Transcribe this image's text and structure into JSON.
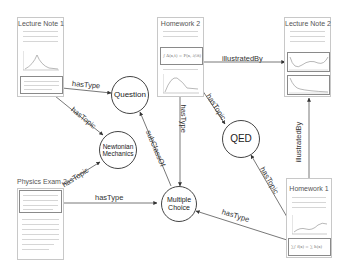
{
  "documents": [
    {
      "id": "lecture-note-1",
      "title": "Lecture Note 1"
    },
    {
      "id": "homework-2",
      "title": "Homework 2"
    },
    {
      "id": "lecture-note-2",
      "title": "Lecture Note 2"
    },
    {
      "id": "physics-exam-2",
      "title": "Physics Exam 2"
    },
    {
      "id": "homework-1",
      "title": "Homework 1"
    }
  ],
  "concepts": [
    {
      "id": "question",
      "label": "Question"
    },
    {
      "id": "newtonian-mechanics",
      "label_line1": "Newtonian",
      "label_line2": "Mechanics"
    },
    {
      "id": "qed",
      "label": "QED"
    },
    {
      "id": "multiple-choice",
      "label_line1": "Multiple",
      "label_line2": "Choice"
    }
  ],
  "edges": [
    {
      "from": "lecture-note-1",
      "to": "question",
      "label": "hasType"
    },
    {
      "from": "lecture-note-1",
      "to": "newtonian-mechanics",
      "label": "hasTopic"
    },
    {
      "from": "homework-2",
      "to": "lecture-note-2",
      "label": "illustratedBy"
    },
    {
      "from": "homework-2",
      "to": "qed",
      "label": "hasTopic"
    },
    {
      "from": "homework-2",
      "to": "multiple-choice",
      "label": "hasType"
    },
    {
      "from": "multiple-choice",
      "to": "question",
      "label": "subClassOf"
    },
    {
      "from": "physics-exam-2",
      "to": "newtonian-mechanics",
      "label": "hasTopic"
    },
    {
      "from": "physics-exam-2",
      "to": "multiple-choice",
      "label": "hasType"
    },
    {
      "from": "homework-1",
      "to": "qed",
      "label": "hasTopic"
    },
    {
      "from": "homework-1",
      "to": "multiple-choice",
      "label": "hasType"
    },
    {
      "from": "homework-1",
      "to": "lecture-note-2",
      "label": "illustratedBy"
    }
  ],
  "formulas": {
    "homework2": "∫ A(x,t) = F(x, ∂/∂t)",
    "homework1": "∑∫ f(x) = ∑ h(x)"
  }
}
